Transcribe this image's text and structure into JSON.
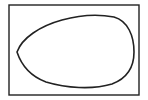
{
  "diagram": {
    "frame": {
      "x": 9,
      "y": 5,
      "width": 130,
      "height": 90,
      "stroke": "#222222",
      "stroke_width": 1.4
    },
    "shape": {
      "kind": "egg-outline",
      "path": "M17,52 C22,38 40,26 62,20 C80,15 98,14 114,17 C128,21 134,36 134,52 C134,66 128,78 112,84 C92,90 66,88 46,82 C30,76 21,64 17,52 Z",
      "stroke": "#222222",
      "stroke_width": 1.6,
      "fill": "none"
    }
  }
}
